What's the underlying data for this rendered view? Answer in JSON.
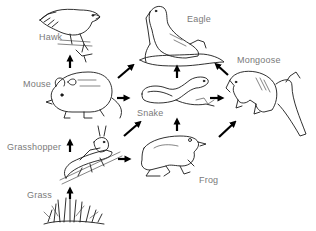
{
  "diagram": {
    "type": "food-web",
    "organisms": [
      {
        "id": "hawk",
        "label": "Hawk"
      },
      {
        "id": "eagle",
        "label": "Eagle"
      },
      {
        "id": "mongoose",
        "label": "Mongoose"
      },
      {
        "id": "mouse",
        "label": "Mouse"
      },
      {
        "id": "snake",
        "label": "Snake"
      },
      {
        "id": "grasshopper",
        "label": "Grasshopper"
      },
      {
        "id": "frog",
        "label": "Frog"
      },
      {
        "id": "grass",
        "label": "Grass"
      }
    ],
    "links": [
      {
        "from": "grass",
        "to": "grasshopper"
      },
      {
        "from": "grasshopper",
        "to": "mouse"
      },
      {
        "from": "grasshopper",
        "to": "snake"
      },
      {
        "from": "grasshopper",
        "to": "frog"
      },
      {
        "from": "mouse",
        "to": "hawk"
      },
      {
        "from": "mouse",
        "to": "eagle"
      },
      {
        "from": "mouse",
        "to": "snake"
      },
      {
        "from": "frog",
        "to": "snake"
      },
      {
        "from": "frog",
        "to": "mongoose"
      },
      {
        "from": "snake",
        "to": "eagle"
      },
      {
        "from": "snake",
        "to": "mongoose"
      },
      {
        "from": "mongoose",
        "to": "eagle"
      }
    ],
    "colors": {
      "label": "#7a7a7a",
      "arrow": "#000000",
      "line_art": "#1a1a1a",
      "background": "#ffffff"
    }
  }
}
